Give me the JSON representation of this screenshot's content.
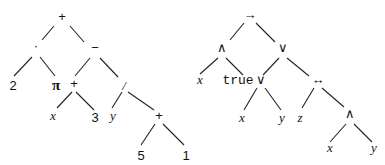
{
  "trees": [
    {
      "name": "arithmetic-expression-tree",
      "nodes": [
        {
          "id": "n1",
          "label": "+",
          "style": "lbl",
          "x": 62,
          "y": 21
        },
        {
          "id": "n2",
          "label": "·",
          "style": "lbl",
          "x": 36,
          "y": 50
        },
        {
          "id": "n3",
          "label": "−",
          "style": "lbl",
          "x": 95,
          "y": 52
        },
        {
          "id": "n4",
          "label": "2",
          "style": "lbl",
          "x": 13,
          "y": 90
        },
        {
          "id": "n5",
          "label": "π",
          "style": "bold",
          "x": 56,
          "y": 90
        },
        {
          "id": "n6",
          "label": "+",
          "style": "lbl",
          "x": 74,
          "y": 88
        },
        {
          "id": "n7",
          "label": "/",
          "style": "var",
          "x": 124,
          "y": 90
        },
        {
          "id": "n8",
          "label": "x",
          "style": "var",
          "x": 53,
          "y": 120
        },
        {
          "id": "n9",
          "label": "3",
          "style": "lbl",
          "x": 95,
          "y": 122
        },
        {
          "id": "n10",
          "label": "y",
          "style": "var",
          "x": 113,
          "y": 120
        },
        {
          "id": "n11",
          "label": "+",
          "style": "lbl",
          "x": 159,
          "y": 120
        },
        {
          "id": "n12",
          "label": "5",
          "style": "lbl",
          "x": 141,
          "y": 160
        },
        {
          "id": "n13",
          "label": "1",
          "style": "lbl",
          "x": 186,
          "y": 160
        }
      ],
      "edges": [
        [
          54,
          26,
          42,
          40
        ],
        [
          70,
          26,
          84,
          42
        ],
        [
          32,
          57,
          14,
          76
        ],
        [
          40,
          57,
          55,
          76
        ],
        [
          90,
          58,
          75,
          76
        ],
        [
          100,
          58,
          118,
          77
        ],
        [
          72,
          92,
          57,
          108
        ],
        [
          76,
          92,
          94,
          110
        ],
        [
          122,
          92,
          112,
          108
        ],
        [
          128,
          92,
          154,
          110
        ],
        [
          155,
          124,
          141,
          145
        ],
        [
          163,
          124,
          184,
          145
        ]
      ]
    },
    {
      "name": "logic-formula-tree",
      "nodes": [
        {
          "id": "m1",
          "label": "→",
          "style": "lbl",
          "x": 250,
          "y": 19
        },
        {
          "id": "m2",
          "label": "∧",
          "style": "lbl",
          "x": 222,
          "y": 52
        },
        {
          "id": "m3",
          "label": "∨",
          "style": "lbl",
          "x": 283,
          "y": 52
        },
        {
          "id": "m4",
          "label": "x",
          "style": "var",
          "x": 200,
          "y": 84
        },
        {
          "id": "m5",
          "label": "true",
          "style": "mono",
          "x": 238,
          "y": 84
        },
        {
          "id": "m6",
          "label": "∨",
          "style": "lbl",
          "x": 261,
          "y": 84
        },
        {
          "id": "m7",
          "label": "↔",
          "style": "lbl",
          "x": 318,
          "y": 84
        },
        {
          "id": "m8",
          "label": "x",
          "style": "var",
          "x": 242,
          "y": 122
        },
        {
          "id": "m9",
          "label": "y",
          "style": "var",
          "x": 282,
          "y": 122
        },
        {
          "id": "m10",
          "label": "z",
          "style": "var",
          "x": 300,
          "y": 122
        },
        {
          "id": "m11",
          "label": "∧",
          "style": "lbl",
          "x": 350,
          "y": 118
        },
        {
          "id": "m12",
          "label": "x",
          "style": "var",
          "x": 330,
          "y": 152
        },
        {
          "id": "m13",
          "label": "y",
          "style": "var",
          "x": 374,
          "y": 152
        }
      ],
      "edges": [
        [
          244,
          23,
          230,
          40
        ],
        [
          256,
          23,
          275,
          42
        ],
        [
          218,
          58,
          200,
          74
        ],
        [
          226,
          58,
          243,
          75
        ],
        [
          279,
          58,
          263,
          75
        ],
        [
          287,
          58,
          309,
          76
        ],
        [
          257,
          88,
          244,
          110
        ],
        [
          265,
          88,
          281,
          110
        ],
        [
          314,
          88,
          302,
          108
        ],
        [
          322,
          88,
          344,
          107
        ],
        [
          346,
          124,
          330,
          142
        ],
        [
          354,
          124,
          372,
          142
        ]
      ]
    }
  ]
}
